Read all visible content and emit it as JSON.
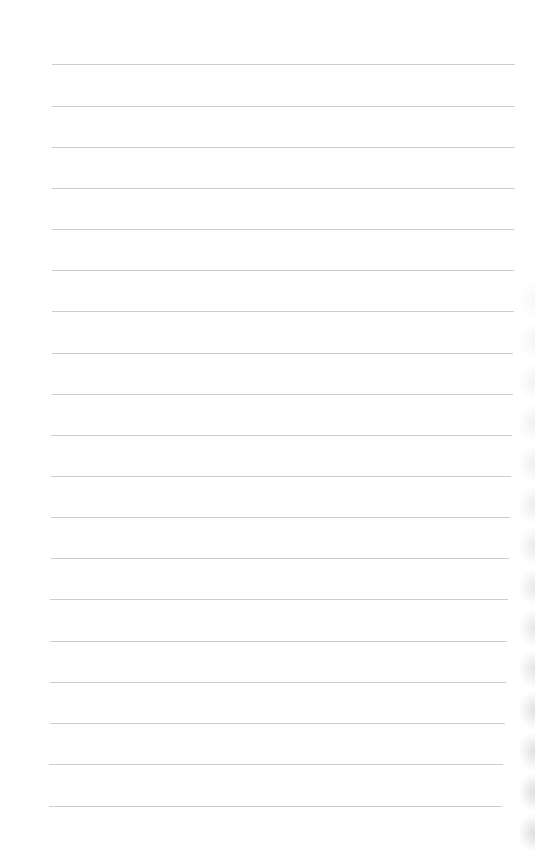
{
  "page": {
    "type": "lined-notepad-paper",
    "background_color": "#ffffff",
    "rule_color": "#c9c9c9",
    "rule_count": 19,
    "rules": [
      {
        "y": 64,
        "x1": 52,
        "x2": 515
      },
      {
        "y": 106,
        "x1": 52,
        "x2": 515
      },
      {
        "y": 147,
        "x1": 52,
        "x2": 515
      },
      {
        "y": 188,
        "x1": 52,
        "x2": 515
      },
      {
        "y": 229,
        "x1": 52,
        "x2": 514
      },
      {
        "y": 270,
        "x1": 52,
        "x2": 514
      },
      {
        "y": 311,
        "x1": 52,
        "x2": 514
      },
      {
        "y": 353,
        "x1": 52,
        "x2": 513
      },
      {
        "y": 394,
        "x1": 52,
        "x2": 513
      },
      {
        "y": 435,
        "x1": 51,
        "x2": 512
      },
      {
        "y": 476,
        "x1": 51,
        "x2": 511
      },
      {
        "y": 517,
        "x1": 51,
        "x2": 510
      },
      {
        "y": 558,
        "x1": 51,
        "x2": 509
      },
      {
        "y": 599,
        "x1": 50,
        "x2": 508
      },
      {
        "y": 641,
        "x1": 50,
        "x2": 507
      },
      {
        "y": 682,
        "x1": 50,
        "x2": 506
      },
      {
        "y": 723,
        "x1": 50,
        "x2": 505
      },
      {
        "y": 764,
        "x1": 49,
        "x2": 503
      },
      {
        "y": 806,
        "x1": 49,
        "x2": 502
      }
    ],
    "scallops": [
      300,
      341,
      382,
      423,
      464,
      505,
      546,
      587,
      628,
      669,
      710,
      751,
      792,
      833
    ]
  }
}
